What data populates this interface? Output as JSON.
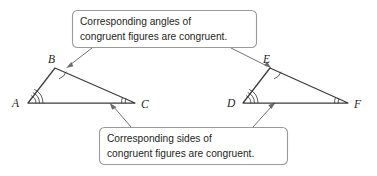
{
  "figure": {
    "background_color": "#ffffff",
    "line_color": "#3c3c3c",
    "leader_color": "#6b6b6b",
    "text_color": "#231f20",
    "box_border_color": "#9a9a9a"
  },
  "callouts": {
    "angles": {
      "line1": "Corresponding angles of",
      "line2": "congruent figures are congruent."
    },
    "sides": {
      "line1": "Corresponding sides of",
      "line2": "congruent figures are congruent."
    }
  },
  "triangles": [
    {
      "name": "triangle-abc",
      "vertices": [
        {
          "label": "A",
          "x": 28,
          "y": 103,
          "arc_count": 3
        },
        {
          "label": "B",
          "x": 55,
          "y": 68,
          "arc_count": 1
        },
        {
          "label": "C",
          "x": 135,
          "y": 103,
          "arc_count": 2
        }
      ]
    },
    {
      "name": "triangle-def",
      "vertices": [
        {
          "label": "D",
          "x": 243,
          "y": 103,
          "arc_count": 3
        },
        {
          "label": "E",
          "x": 270,
          "y": 68,
          "arc_count": 1
        },
        {
          "label": "F",
          "x": 348,
          "y": 103,
          "arc_count": 2
        }
      ]
    }
  ],
  "vertex_labels": {
    "a": "A",
    "b": "B",
    "c": "C",
    "d": "D",
    "e": "E",
    "f": "F"
  }
}
